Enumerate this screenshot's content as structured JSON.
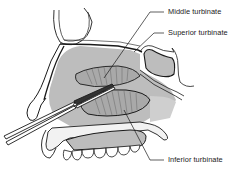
{
  "figure": {
    "labels": [
      {
        "id": "middle",
        "text": "Middle turbinate"
      },
      {
        "id": "superior",
        "text": "Superior turbinate"
      },
      {
        "id": "inferior",
        "text": "Inferior turbinate"
      }
    ]
  },
  "colors": {
    "line": "#1a1a1a",
    "tissue_fill": "#bdbdbd",
    "turbinate_fill": "#a9a9a9",
    "bone_fill": "#f2f2f2",
    "background": "#ffffff"
  }
}
